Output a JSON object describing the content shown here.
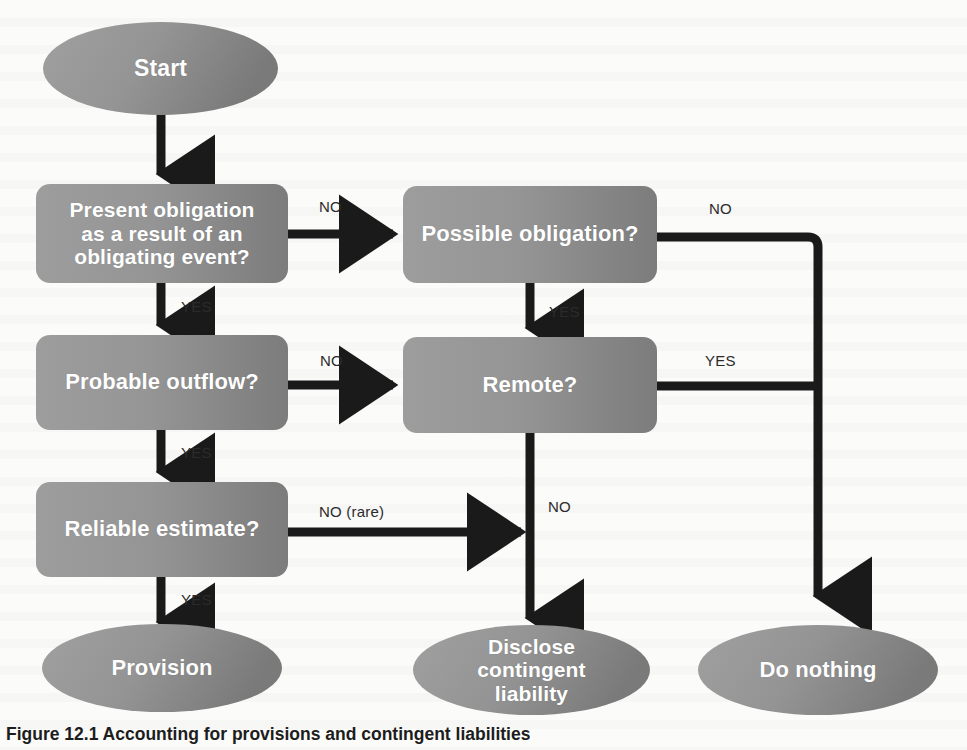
{
  "figure": {
    "type": "flowchart",
    "title": "Accounting for provisions and contingent liabilities",
    "caption": "Figure 12.1 Accounting for provisions and contingent liabilities",
    "colors": {
      "node_fill_light": "#9a9a9a",
      "node_fill_dark": "#7d7d7d",
      "node_text": "#ffffff",
      "connector": "#1a1a1a",
      "edge_label_text": "#2b2b2b",
      "background": "#fbfbfa"
    }
  },
  "nodes": {
    "start": {
      "id": "start",
      "shape": "ellipse",
      "label": "Start"
    },
    "present_obligation": {
      "id": "present_obligation",
      "shape": "rounded-rect",
      "label": "Present obligation\nas a result of an\nobligating event?"
    },
    "probable_outflow": {
      "id": "probable_outflow",
      "shape": "rounded-rect",
      "label": "Probable outflow?"
    },
    "reliable_estimate": {
      "id": "reliable_estimate",
      "shape": "rounded-rect",
      "label": "Reliable estimate?"
    },
    "possible_obligation": {
      "id": "possible_obligation",
      "shape": "rounded-rect",
      "label": "Possible obligation?"
    },
    "remote": {
      "id": "remote",
      "shape": "rounded-rect",
      "label": "Remote?"
    },
    "provision": {
      "id": "provision",
      "shape": "ellipse",
      "label": "Provision"
    },
    "disclose_contingent_liability": {
      "id": "disclose_contingent_liability",
      "shape": "ellipse",
      "label": "Disclose\ncontingent\nliability"
    },
    "do_nothing": {
      "id": "do_nothing",
      "shape": "ellipse",
      "label": "Do nothing"
    }
  },
  "edges": [
    {
      "id": "e1",
      "from": "start",
      "to": "present_obligation",
      "label": ""
    },
    {
      "id": "e2",
      "from": "present_obligation",
      "to": "probable_outflow",
      "label": "YES"
    },
    {
      "id": "e3",
      "from": "present_obligation",
      "to": "possible_obligation",
      "label": "NO"
    },
    {
      "id": "e4",
      "from": "probable_outflow",
      "to": "reliable_estimate",
      "label": "YES"
    },
    {
      "id": "e5",
      "from": "probable_outflow",
      "to": "remote",
      "label": "NO"
    },
    {
      "id": "e6",
      "from": "reliable_estimate",
      "to": "provision",
      "label": "YES"
    },
    {
      "id": "e7",
      "from": "reliable_estimate",
      "to": "disclose_contingent_liability",
      "label": "NO (rare)"
    },
    {
      "id": "e8",
      "from": "possible_obligation",
      "to": "remote",
      "label": "YES"
    },
    {
      "id": "e9",
      "from": "possible_obligation",
      "to": "do_nothing",
      "label": "NO"
    },
    {
      "id": "e10",
      "from": "remote",
      "to": "do_nothing",
      "label": "YES"
    },
    {
      "id": "e11",
      "from": "remote",
      "to": "disclose_contingent_liability",
      "label": "NO"
    }
  ],
  "edge_labels": {
    "present_to_possible": "NO",
    "present_to_probable": "YES",
    "probable_to_remote": "NO",
    "probable_to_reliable": "YES",
    "reliable_to_disclose": "NO (rare)",
    "reliable_to_provision": "YES",
    "possible_to_remote": "YES",
    "possible_to_donothing": "NO",
    "remote_to_donothing": "YES",
    "remote_to_disclose": "NO"
  }
}
